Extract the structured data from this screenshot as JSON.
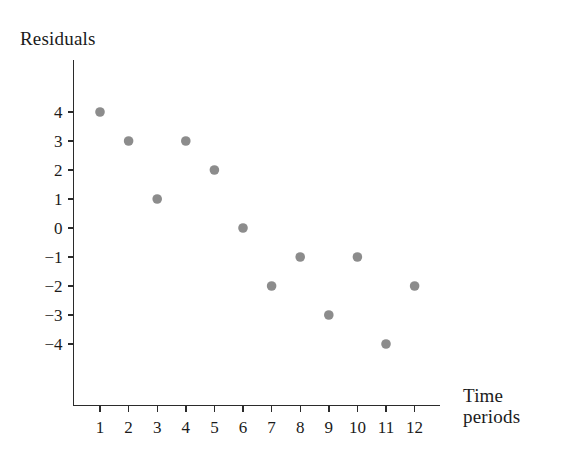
{
  "chart_data": {
    "type": "scatter",
    "title": "",
    "xlabel": "Time periods",
    "ylabel": "Residuals",
    "x": [
      1,
      2,
      3,
      4,
      5,
      6,
      7,
      8,
      9,
      10,
      11,
      12
    ],
    "values": [
      4,
      3,
      1,
      3,
      2,
      0,
      -2,
      -1,
      -3,
      -1,
      -4,
      -2
    ],
    "series": [
      {
        "name": "Residuals",
        "values": [
          4,
          3,
          1,
          3,
          2,
          0,
          -2,
          -1,
          -3,
          -1,
          -4,
          -2
        ]
      }
    ],
    "xtick_labels": [
      "1",
      "2",
      "3",
      "4",
      "5",
      "6",
      "7",
      "8",
      "9",
      "10",
      "11",
      "12"
    ],
    "ytick_labels": [
      "4",
      "3",
      "2",
      "1",
      "0",
      "−1",
      "−2",
      "−3",
      "−4"
    ],
    "ytick_values": [
      4,
      3,
      2,
      1,
      0,
      -1,
      -2,
      -3,
      -4
    ],
    "xlim": [
      0.45,
      13.1
    ],
    "ylim": [
      -6.6,
      6.0
    ],
    "grid": false,
    "legend": false,
    "point_color": "#8c8c8c",
    "axis_color": "#2b2b2b",
    "background_color": "#ffffff"
  },
  "axis_titles": {
    "y": "Residuals",
    "x_line1": "Time",
    "x_line2": "periods"
  }
}
